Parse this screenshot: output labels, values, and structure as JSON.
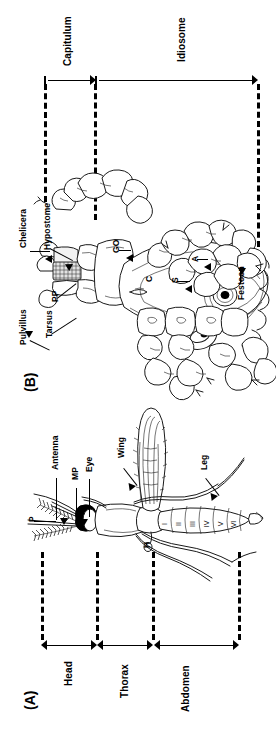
{
  "figure": {
    "orientation": "rotated-90-ccw",
    "ink_color": "#1a1a1a",
    "background": "#ffffff"
  },
  "panels": [
    {
      "id": "B",
      "tag": "(B)",
      "subject": "tick-dorsal-anatomy",
      "regions": [
        {
          "name": "capitulum",
          "label": "Capitulum"
        },
        {
          "name": "idiosome",
          "label": "Idiosome"
        }
      ],
      "labels": [
        {
          "name": "chelicera",
          "text": "Chelicera"
        },
        {
          "name": "hypostome",
          "text": "Hypostome"
        },
        {
          "name": "pedipalp",
          "text": "PP"
        },
        {
          "name": "pulvillus",
          "text": "Pulvillus"
        },
        {
          "name": "tarsus",
          "text": "Tarsus"
        },
        {
          "name": "genital-opening",
          "text": "GO"
        },
        {
          "name": "coxa",
          "text": "C"
        },
        {
          "name": "spiracle",
          "text": "S"
        },
        {
          "name": "anus",
          "text": "A"
        },
        {
          "name": "festoon",
          "text": "Festoon"
        }
      ]
    },
    {
      "id": "A",
      "tag": "(A)",
      "subject": "mosquito-lateral-anatomy",
      "regions": [
        {
          "name": "head",
          "label": "Head"
        },
        {
          "name": "thorax",
          "label": "Thorax"
        },
        {
          "name": "abdomen",
          "label": "Abdomen"
        }
      ],
      "labels": [
        {
          "name": "antenna",
          "text": "Antenna"
        },
        {
          "name": "maxillary-palp",
          "text": "MP"
        },
        {
          "name": "eye",
          "text": "Eye"
        },
        {
          "name": "wing",
          "text": "Wing"
        },
        {
          "name": "leg",
          "text": "Leg"
        },
        {
          "name": "proboscis",
          "text": "P"
        },
        {
          "name": "haltere",
          "text": "H"
        }
      ],
      "abdominal_segments": [
        "I",
        "II",
        "III",
        "IV",
        "V",
        "VI"
      ]
    }
  ]
}
